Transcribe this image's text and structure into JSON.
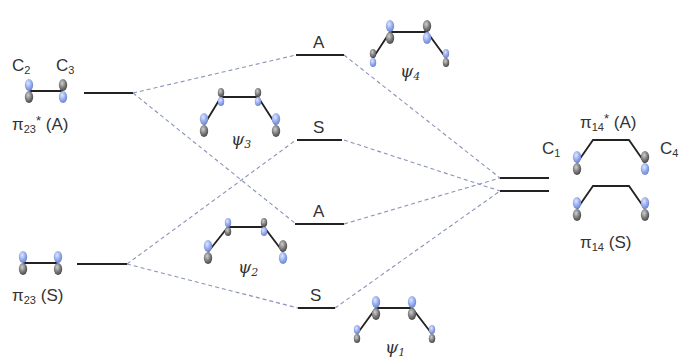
{
  "diagram": {
    "left_orbitals": [
      {
        "id": "pi23_star",
        "symbol": "π",
        "subscript": "23",
        "superscript": "*",
        "symmetry": "(A)",
        "atoms": [
          "C",
          "C"
        ],
        "atom_subs": [
          "2",
          "3"
        ]
      },
      {
        "id": "pi23",
        "symbol": "π",
        "subscript": "23",
        "superscript": "",
        "symmetry": "(S)"
      }
    ],
    "center_levels": [
      {
        "label": "A",
        "mo": "ψ",
        "mo_sub": "4"
      },
      {
        "label": "S",
        "mo": "ψ",
        "mo_sub": "3"
      },
      {
        "label": "A",
        "mo": "ψ",
        "mo_sub": "2"
      },
      {
        "label": "S",
        "mo": "ψ",
        "mo_sub": "1"
      }
    ],
    "right_orbitals": [
      {
        "id": "pi14_star",
        "symbol": "π",
        "subscript": "14",
        "superscript": "*",
        "symmetry": "(A)",
        "atoms": [
          "C",
          "C"
        ],
        "atom_subs": [
          "1",
          "4"
        ]
      },
      {
        "id": "pi14",
        "symbol": "π",
        "subscript": "14",
        "superscript": "",
        "symmetry": "(S)"
      }
    ],
    "colors": {
      "lobe_blue": "#8fa6e8",
      "lobe_gray": "#6f6f6f",
      "level_line": "#222222",
      "dashed": "#8a93b8"
    }
  }
}
